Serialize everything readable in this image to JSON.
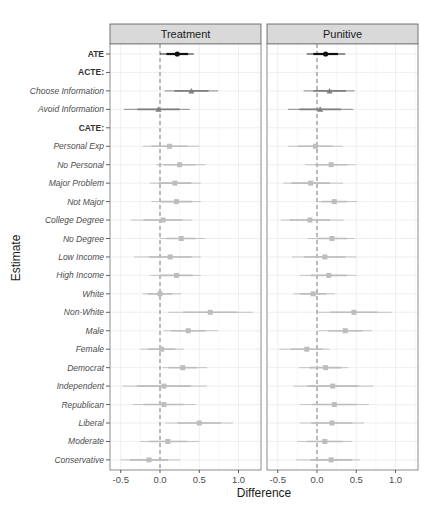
{
  "chart_data": {
    "type": "scatter",
    "subtype": "coefficient-plot-faceted",
    "xlabel": "Difference",
    "ylabel": "Estimate",
    "xlim": [
      -0.62,
      1.3
    ],
    "xticks": [
      -0.5,
      0.0,
      0.5,
      1.0
    ],
    "xtick_labels": [
      "-0.5",
      "0.0",
      "0.5",
      "1.0"
    ],
    "grid": true,
    "reference_line": {
      "x": 0,
      "style": "dashed"
    },
    "categories": [
      "ATE",
      "ACTE:",
      "Choose Information",
      "Avoid Information",
      "CATE:",
      "Personal Exp",
      "No Personal",
      "Major Problem",
      "Not Major",
      "College Degree",
      "No Degree",
      "Low Income",
      "High Income",
      "White",
      "Non-White",
      "Male",
      "Female",
      "Democrat",
      "Independent",
      "Republican",
      "Liberal",
      "Moderate",
      "Conservative"
    ],
    "category_styles": [
      "bold",
      "bold",
      "italic",
      "italic",
      "bold",
      "italic",
      "italic",
      "italic",
      "italic",
      "italic",
      "italic",
      "italic",
      "italic",
      "italic",
      "italic",
      "italic",
      "italic",
      "italic",
      "italic",
      "italic",
      "italic",
      "italic",
      "italic"
    ],
    "panels": [
      {
        "title": "Treatment",
        "rows": [
          {
            "label": "ATE",
            "est": 0.22,
            "lo": 0.0,
            "hi": 0.43,
            "shape": "circle",
            "color": "#111111"
          },
          {
            "label": "ACTE:",
            "est": null,
            "lo": null,
            "hi": null
          },
          {
            "label": "Choose Information",
            "est": 0.4,
            "lo": 0.06,
            "hi": 0.74,
            "shape": "triangle",
            "color": "#7f7f7f"
          },
          {
            "label": "Avoid Information",
            "est": -0.02,
            "lo": -0.46,
            "hi": 0.38,
            "shape": "triangle",
            "color": "#7f7f7f"
          },
          {
            "label": "CATE:",
            "est": null,
            "lo": null,
            "hi": null
          },
          {
            "label": "Personal Exp",
            "est": 0.12,
            "lo": -0.22,
            "hi": 0.5,
            "shape": "square",
            "color": "#bdbdbd"
          },
          {
            "label": "No Personal",
            "est": 0.25,
            "lo": -0.05,
            "hi": 0.58,
            "shape": "square",
            "color": "#bdbdbd"
          },
          {
            "label": "Major Problem",
            "est": 0.19,
            "lo": -0.13,
            "hi": 0.52,
            "shape": "square",
            "color": "#bdbdbd"
          },
          {
            "label": "Not Major",
            "est": 0.21,
            "lo": -0.11,
            "hi": 0.52,
            "shape": "square",
            "color": "#bdbdbd"
          },
          {
            "label": "College Degree",
            "est": 0.04,
            "lo": -0.37,
            "hi": 0.41,
            "shape": "square",
            "color": "#bdbdbd"
          },
          {
            "label": "No Degree",
            "est": 0.27,
            "lo": 0.0,
            "hi": 0.58,
            "shape": "square",
            "color": "#bdbdbd"
          },
          {
            "label": "Low Income",
            "est": 0.13,
            "lo": -0.33,
            "hi": 0.52,
            "shape": "square",
            "color": "#bdbdbd"
          },
          {
            "label": "High Income",
            "est": 0.21,
            "lo": -0.13,
            "hi": 0.52,
            "shape": "square",
            "color": "#bdbdbd"
          },
          {
            "label": "White",
            "est": 0.0,
            "lo": -0.22,
            "hi": 0.27,
            "shape": "square",
            "color": "#bdbdbd"
          },
          {
            "label": "Non-White",
            "est": 0.64,
            "lo": 0.1,
            "hi": 1.18,
            "shape": "square",
            "color": "#bdbdbd"
          },
          {
            "label": "Male",
            "est": 0.36,
            "lo": 0.05,
            "hi": 0.74,
            "shape": "square",
            "color": "#bdbdbd"
          },
          {
            "label": "Female",
            "est": 0.02,
            "lo": -0.25,
            "hi": 0.3,
            "shape": "square",
            "color": "#bdbdbd"
          },
          {
            "label": "Democrat",
            "est": 0.29,
            "lo": 0.03,
            "hi": 0.6,
            "shape": "square",
            "color": "#bdbdbd"
          },
          {
            "label": "Independent",
            "est": 0.05,
            "lo": -0.48,
            "hi": 0.6,
            "shape": "square",
            "color": "#bdbdbd"
          },
          {
            "label": "Republican",
            "est": 0.05,
            "lo": -0.35,
            "hi": 0.46,
            "shape": "square",
            "color": "#bdbdbd"
          },
          {
            "label": "Liberal",
            "est": 0.5,
            "lo": 0.07,
            "hi": 0.93,
            "shape": "square",
            "color": "#bdbdbd"
          },
          {
            "label": "Moderate",
            "est": 0.1,
            "lo": -0.25,
            "hi": 0.5,
            "shape": "square",
            "color": "#bdbdbd"
          },
          {
            "label": "Conservative",
            "est": -0.14,
            "lo": -0.5,
            "hi": 0.26,
            "shape": "square",
            "color": "#bdbdbd"
          }
        ]
      },
      {
        "title": "Punitive",
        "rows": [
          {
            "label": "ATE",
            "est": 0.11,
            "lo": -0.13,
            "hi": 0.36,
            "shape": "circle",
            "color": "#111111"
          },
          {
            "label": "ACTE:",
            "est": null,
            "lo": null,
            "hi": null
          },
          {
            "label": "Choose Information",
            "est": 0.16,
            "lo": -0.17,
            "hi": 0.48,
            "shape": "triangle",
            "color": "#7f7f7f"
          },
          {
            "label": "Avoid Information",
            "est": 0.04,
            "lo": -0.37,
            "hi": 0.46,
            "shape": "triangle",
            "color": "#7f7f7f"
          },
          {
            "label": "CATE:",
            "est": null,
            "lo": null,
            "hi": null
          },
          {
            "label": "Personal Exp",
            "est": -0.02,
            "lo": -0.37,
            "hi": 0.33,
            "shape": "square",
            "color": "#bdbdbd"
          },
          {
            "label": "No Personal",
            "est": 0.18,
            "lo": -0.15,
            "hi": 0.49,
            "shape": "square",
            "color": "#bdbdbd"
          },
          {
            "label": "Major Problem",
            "est": -0.08,
            "lo": -0.43,
            "hi": 0.33,
            "shape": "square",
            "color": "#bdbdbd"
          },
          {
            "label": "Not Major",
            "est": 0.22,
            "lo": 0.0,
            "hi": 0.51,
            "shape": "square",
            "color": "#bdbdbd"
          },
          {
            "label": "College Degree",
            "est": -0.09,
            "lo": -0.46,
            "hi": 0.34,
            "shape": "square",
            "color": "#bdbdbd"
          },
          {
            "label": "No Degree",
            "est": 0.19,
            "lo": -0.12,
            "hi": 0.48,
            "shape": "square",
            "color": "#bdbdbd"
          },
          {
            "label": "Low Income",
            "est": 0.1,
            "lo": -0.32,
            "hi": 0.5,
            "shape": "square",
            "color": "#bdbdbd"
          },
          {
            "label": "High Income",
            "est": 0.15,
            "lo": -0.22,
            "hi": 0.5,
            "shape": "square",
            "color": "#bdbdbd"
          },
          {
            "label": "White",
            "est": -0.05,
            "lo": -0.3,
            "hi": 0.23,
            "shape": "square",
            "color": "#bdbdbd"
          },
          {
            "label": "Non-White",
            "est": 0.47,
            "lo": 0.0,
            "hi": 0.95,
            "shape": "square",
            "color": "#bdbdbd"
          },
          {
            "label": "Male",
            "est": 0.36,
            "lo": 0.02,
            "hi": 0.7,
            "shape": "square",
            "color": "#bdbdbd"
          },
          {
            "label": "Female",
            "est": -0.13,
            "lo": -0.48,
            "hi": 0.16,
            "shape": "square",
            "color": "#bdbdbd"
          },
          {
            "label": "Democrat",
            "est": 0.11,
            "lo": -0.23,
            "hi": 0.4,
            "shape": "square",
            "color": "#bdbdbd"
          },
          {
            "label": "Independent",
            "est": 0.2,
            "lo": -0.3,
            "hi": 0.72,
            "shape": "square",
            "color": "#bdbdbd"
          },
          {
            "label": "Republican",
            "est": 0.22,
            "lo": -0.22,
            "hi": 0.66,
            "shape": "square",
            "color": "#bdbdbd"
          },
          {
            "label": "Liberal",
            "est": 0.19,
            "lo": -0.22,
            "hi": 0.6,
            "shape": "square",
            "color": "#bdbdbd"
          },
          {
            "label": "Moderate",
            "est": 0.1,
            "lo": -0.25,
            "hi": 0.45,
            "shape": "square",
            "color": "#bdbdbd"
          },
          {
            "label": "Conservative",
            "est": 0.18,
            "lo": -0.27,
            "hi": 0.55,
            "shape": "square",
            "color": "#bdbdbd"
          }
        ]
      }
    ]
  },
  "colors": {
    "strip_bg": "#d9d9d9",
    "panel_border": "#808080",
    "grid": "#ebebeb",
    "zero_line": "#7f7f7f"
  }
}
